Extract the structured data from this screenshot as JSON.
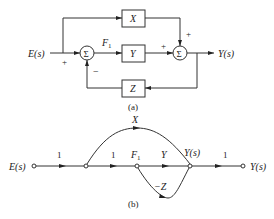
{
  "diagram_a": {
    "caption": "(a)",
    "input_label": "E(s)",
    "output_label": "Y(s)",
    "blocks": [
      {
        "id": "X",
        "label": "X"
      },
      {
        "id": "Y",
        "label": "Y"
      },
      {
        "id": "Z",
        "label": "Z"
      }
    ],
    "summing_junctions": [
      {
        "id": "sum1",
        "symbol": "Σ",
        "input_signs": {
          "left": "+",
          "bottom": "−"
        }
      },
      {
        "id": "sum2",
        "symbol": "Σ",
        "input_signs": {
          "left": "+",
          "top": "+"
        }
      }
    ],
    "signal_labels": {
      "f1": "F",
      "f1_sub": "1"
    },
    "signs": {
      "sum1_plus": "+",
      "sum1_minus": "−",
      "sum2_plus_left": "+",
      "sum2_plus_top": "+"
    }
  },
  "diagram_b": {
    "caption": "(b)",
    "input_label": "E(s)",
    "output_label": "Y(s)",
    "nodes": [
      {
        "id": "n0",
        "label": "E(s)"
      },
      {
        "id": "n1",
        "label": ""
      },
      {
        "id": "n2",
        "label": "F",
        "sub": "1"
      },
      {
        "id": "n3",
        "label": "Y(s)"
      },
      {
        "id": "n4",
        "label": "Y(s)"
      }
    ],
    "branches": [
      {
        "from": "n0",
        "to": "n1",
        "gain": "1"
      },
      {
        "from": "n1",
        "to": "n2",
        "gain": "1"
      },
      {
        "from": "n2",
        "to": "n3",
        "gain": "Y"
      },
      {
        "from": "n1",
        "to": "n3",
        "gain": "X"
      },
      {
        "from": "n3",
        "to": "n2",
        "gain": "−Z"
      },
      {
        "from": "n3",
        "to": "n4",
        "gain": "1"
      }
    ],
    "f1_main": "F",
    "f1_sub": "1",
    "mid_node_label": "Y(s)",
    "gain_1a": "1",
    "gain_1b": "1",
    "gain_y": "Y",
    "gain_x": "X",
    "gain_negz": "−Z",
    "gain_1c": "1"
  }
}
